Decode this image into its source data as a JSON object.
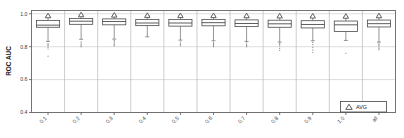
{
  "chart_data": {
    "type": "box",
    "title": "",
    "xlabel": "",
    "ylabel": "ROC AUC",
    "ylim": [
      0.4,
      1.02
    ],
    "yticks": [
      0.4,
      0.6,
      0.8,
      1.0
    ],
    "ytick_labels": [
      "0.4",
      "0.6",
      "0.8",
      "1.0"
    ],
    "grid": true,
    "grid_axis": "y",
    "categories": [
      "0.1",
      "0.2",
      "0.3",
      "0.4",
      "0.5",
      "0.6",
      "0.7",
      "0.8",
      "0.9",
      "1.0",
      "all"
    ],
    "xtick_labels": [
      "0.1",
      "0.2",
      "0.3",
      "0.4",
      "0.5",
      "0.6",
      "0.7",
      "0.8",
      "0.9",
      "1.0",
      "all"
    ],
    "legend": {
      "position": "bottom-right",
      "entries": [
        {
          "label": "AVG",
          "marker": "triangle-up"
        }
      ]
    },
    "boxes": [
      {
        "category": "0.1",
        "q1": 0.918,
        "median": 0.931,
        "q3": 0.96,
        "whisker_low": 0.832,
        "whisker_high": 0.985,
        "mean": 0.988,
        "outliers": [
          0.818,
          0.812,
          0.806,
          0.796,
          0.786,
          0.742
        ]
      },
      {
        "category": "0.2",
        "q1": 0.936,
        "median": 0.955,
        "q3": 0.972,
        "whisker_low": 0.845,
        "whisker_high": 0.992,
        "mean": 0.994,
        "outliers": [
          0.83,
          0.822,
          0.812,
          0.805,
          0.8
        ]
      },
      {
        "category": "0.3",
        "q1": 0.933,
        "median": 0.953,
        "q3": 0.969,
        "whisker_low": 0.846,
        "whisker_high": 0.99,
        "mean": 0.992,
        "outliers": [
          0.838,
          0.83,
          0.823,
          0.816,
          0.81,
          0.805
        ]
      },
      {
        "category": "0.4",
        "q1": 0.928,
        "median": 0.944,
        "q3": 0.966,
        "whisker_low": 0.86,
        "whisker_high": 0.988,
        "mean": 0.99,
        "outliers": []
      },
      {
        "category": "0.5",
        "q1": 0.925,
        "median": 0.944,
        "q3": 0.965,
        "whisker_low": 0.84,
        "whisker_high": 0.987,
        "mean": 0.989,
        "outliers": [
          0.83,
          0.822,
          0.813,
          0.806
        ]
      },
      {
        "category": "0.6",
        "q1": 0.927,
        "median": 0.946,
        "q3": 0.966,
        "whisker_low": 0.836,
        "whisker_high": 0.987,
        "mean": 0.989,
        "outliers": [
          0.828,
          0.82,
          0.812,
          0.806,
          0.8
        ]
      },
      {
        "category": "0.7",
        "q1": 0.922,
        "median": 0.941,
        "q3": 0.963,
        "whisker_low": 0.832,
        "whisker_high": 0.985,
        "mean": 0.988,
        "outliers": [
          0.824,
          0.815,
          0.808,
          0.8
        ]
      },
      {
        "category": "0.8",
        "q1": 0.918,
        "median": 0.939,
        "q3": 0.961,
        "whisker_low": 0.828,
        "whisker_high": 0.984,
        "mean": 0.987,
        "outliers": [
          0.82,
          0.812,
          0.804,
          0.79,
          0.778
        ]
      },
      {
        "category": "0.9",
        "q1": 0.914,
        "median": 0.935,
        "q3": 0.958,
        "whisker_low": 0.836,
        "whisker_high": 0.982,
        "mean": 0.986,
        "outliers": [
          0.826,
          0.812,
          0.796,
          0.78,
          0.766
        ]
      },
      {
        "category": "1.0",
        "q1": 0.893,
        "median": 0.933,
        "q3": 0.956,
        "whisker_low": 0.838,
        "whisker_high": 0.982,
        "mean": 0.985,
        "outliers": [
          0.76
        ]
      },
      {
        "category": "all",
        "q1": 0.92,
        "median": 0.94,
        "q3": 0.962,
        "whisker_low": 0.828,
        "whisker_high": 0.986,
        "mean": 0.988,
        "outliers": [
          0.822,
          0.814,
          0.806,
          0.798,
          0.79,
          0.782
        ]
      }
    ],
    "colors": {
      "box_fill": "#ffffff",
      "box_edge": "#4a4a4a",
      "median": "#4a4a4a",
      "whisker": "#6a6a6a",
      "outlier": "#8a8a8a",
      "grid": "#cfcfcf",
      "axis": "#555555",
      "panel_separator": "#b8b8b8"
    }
  }
}
